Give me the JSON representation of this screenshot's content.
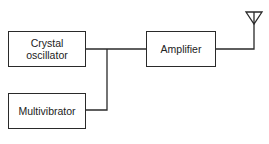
{
  "diagram": {
    "type": "block-diagram",
    "blocks": [
      {
        "id": "crystal",
        "lines": [
          "Crystal",
          "oscillator"
        ]
      },
      {
        "id": "multivibrator",
        "lines": [
          "Multivibrator"
        ]
      },
      {
        "id": "amplifier",
        "lines": [
          "Amplifier"
        ]
      }
    ],
    "antenna": {
      "label": "antenna-icon"
    },
    "connections": [
      {
        "from": "crystal",
        "to": "amplifier"
      },
      {
        "from": "multivibrator",
        "to": "amplifier"
      },
      {
        "from": "amplifier",
        "to": "antenna"
      }
    ],
    "line_color": "#2a2a2a"
  }
}
